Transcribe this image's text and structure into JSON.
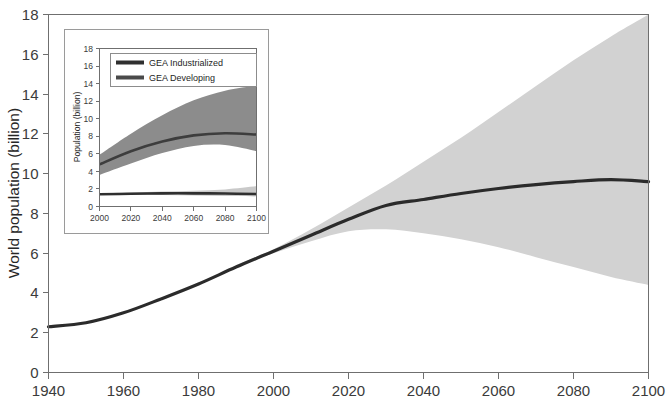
{
  "chart_data": {
    "type": "line",
    "title": "",
    "xlabel": "",
    "ylabel": "World population (billion)",
    "xlim": [
      1940,
      2100
    ],
    "ylim": [
      0,
      18
    ],
    "grid": false,
    "x_ticks": [
      1940,
      1960,
      1980,
      2000,
      2020,
      2040,
      2060,
      2080,
      2100
    ],
    "y_ticks": [
      0,
      2,
      4,
      6,
      8,
      10,
      12,
      14,
      16,
      18
    ],
    "colors": {
      "median_line": "#2b2b2b",
      "uncertainty_band": "#d2d2d2",
      "axis": "#6f6f6f",
      "text": "#262626"
    },
    "series": [
      {
        "name": "World population median",
        "x": [
          1940,
          1950,
          1960,
          1970,
          1980,
          1990,
          2000,
          2010,
          2020,
          2030,
          2040,
          2050,
          2060,
          2070,
          2080,
          2090,
          2100
        ],
        "values": [
          2.3,
          2.5,
          3.0,
          3.7,
          4.45,
          5.3,
          6.1,
          6.9,
          7.7,
          8.4,
          8.7,
          9.0,
          9.25,
          9.45,
          9.6,
          9.7,
          9.6
        ]
      },
      {
        "name": "Uncertainty band upper",
        "x": [
          1990,
          2000,
          2010,
          2020,
          2030,
          2040,
          2050,
          2060,
          2070,
          2080,
          2090,
          2100
        ],
        "values": [
          5.4,
          6.2,
          7.2,
          8.3,
          9.4,
          10.6,
          11.8,
          13.1,
          14.4,
          15.7,
          16.9,
          18.0
        ]
      },
      {
        "name": "Uncertainty band lower",
        "x": [
          1990,
          2000,
          2010,
          2020,
          2030,
          2040,
          2050,
          2060,
          2070,
          2080,
          2090,
          2100
        ],
        "values": [
          5.3,
          6.0,
          6.6,
          7.1,
          7.2,
          7.0,
          6.7,
          6.3,
          5.8,
          5.3,
          4.8,
          4.4
        ]
      }
    ],
    "inset": {
      "type": "line",
      "title": "",
      "xlabel": "",
      "ylabel": "Population (billion)",
      "xlim": [
        2000,
        2100
      ],
      "ylim": [
        0,
        18
      ],
      "grid": false,
      "x_ticks": [
        2000,
        2020,
        2040,
        2060,
        2080,
        2100
      ],
      "y_ticks": [
        0,
        2,
        4,
        6,
        8,
        10,
        12,
        14,
        16,
        18
      ],
      "legend_position": "top-left",
      "colors": {
        "industrialized_line": "#2f2f2f",
        "industrialized_band": "#c9c9c9",
        "developing_line": "#3d3d3d",
        "developing_band": "#8c8c8c"
      },
      "series": [
        {
          "name": "GEA Industrialized",
          "x": [
            2000,
            2020,
            2040,
            2060,
            2080,
            2100
          ],
          "values": [
            1.4,
            1.45,
            1.5,
            1.5,
            1.48,
            1.42
          ],
          "band_upper": [
            1.5,
            1.6,
            1.7,
            1.8,
            1.95,
            2.3
          ],
          "band_lower": [
            1.3,
            1.3,
            1.3,
            1.25,
            1.2,
            1.15
          ]
        },
        {
          "name": "GEA Developing",
          "x": [
            2000,
            2020,
            2040,
            2060,
            2080,
            2100
          ],
          "values": [
            4.8,
            6.3,
            7.4,
            8.1,
            8.35,
            8.2
          ],
          "band_upper": [
            5.9,
            8.3,
            10.4,
            12.1,
            13.2,
            13.8
          ],
          "band_lower": [
            3.6,
            4.9,
            6.1,
            6.9,
            7.0,
            6.3
          ]
        }
      ],
      "legend": [
        {
          "label": "GEA Industrialized",
          "color": "#2f2f2f"
        },
        {
          "label": "GEA Developing",
          "color": "#4a4a4a"
        }
      ]
    }
  },
  "main_axis": {
    "y_title": "World population (billion)",
    "y_tick_labels": [
      "0",
      "2",
      "4",
      "6",
      "8",
      "10",
      "12",
      "14",
      "16",
      "18"
    ],
    "x_tick_labels": [
      "1940",
      "1960",
      "1980",
      "2000",
      "2020",
      "2040",
      "2060",
      "2080",
      "2100"
    ]
  },
  "inset_axis": {
    "y_title": "Population (billion)",
    "y_tick_labels": [
      "0",
      "2",
      "4",
      "6",
      "8",
      "10",
      "12",
      "14",
      "16",
      "18"
    ],
    "x_tick_labels": [
      "2000",
      "2020",
      "2040",
      "2060",
      "2080",
      "2100"
    ]
  },
  "legend": {
    "industrialized_label": "GEA Industrialized",
    "developing_label": "GEA Developing"
  }
}
